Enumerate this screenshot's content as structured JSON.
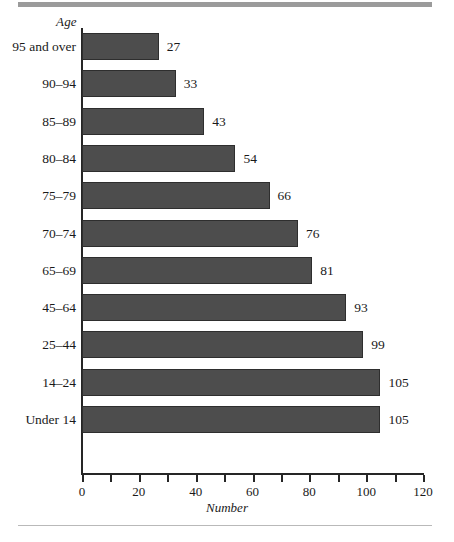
{
  "chart_data": {
    "type": "bar",
    "orientation": "horizontal",
    "title": "",
    "xlabel": "Number",
    "ylabel": "Age",
    "xlim": [
      0,
      120
    ],
    "xticks": [
      0,
      20,
      40,
      60,
      80,
      100,
      120
    ],
    "xtick_labels": [
      "0",
      "20",
      "40",
      "60",
      "80",
      "100",
      "120"
    ],
    "minor_tick_step": 10,
    "grid": false,
    "legend": null,
    "bar_color": "#4d4d4d",
    "categories": [
      "95 and over",
      "90–94",
      "85–89",
      "80–84",
      "75–79",
      "70–74",
      "65–69",
      "45–64",
      "25–44",
      "14–24",
      "Under 14"
    ],
    "values": [
      27,
      33,
      43,
      54,
      66,
      76,
      81,
      93,
      99,
      105,
      105
    ],
    "data_labels": [
      "27",
      "33",
      "43",
      "54",
      "66",
      "76",
      "81",
      "93",
      "99",
      "105",
      "105"
    ]
  }
}
